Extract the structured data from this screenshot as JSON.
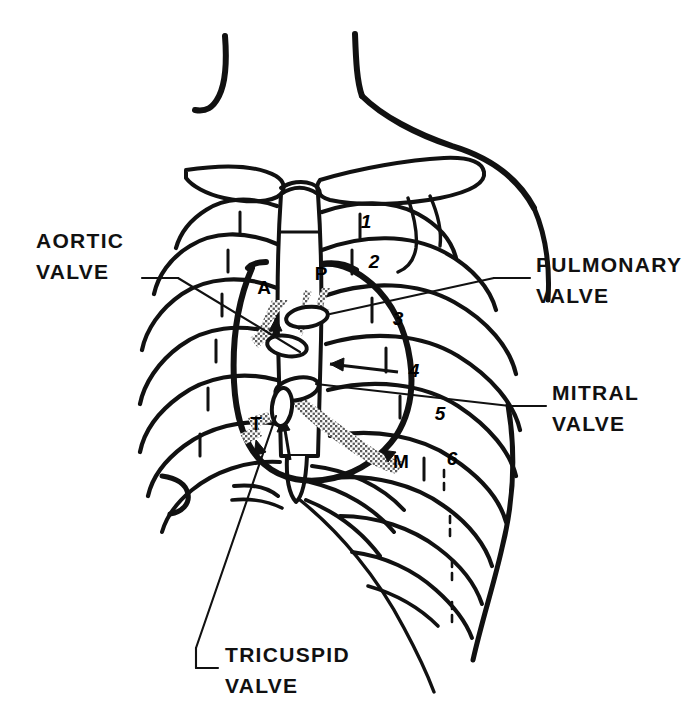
{
  "figure": {
    "background_color": "#ffffff",
    "ink_color": "#111111",
    "stipple_color": "#6e6e6e"
  },
  "labels": [
    {
      "id": "aortic",
      "line1": "AORTIC",
      "line2": "VALVE",
      "marker": "A",
      "x": 36,
      "y": 248,
      "align": "start",
      "marker_x": 264,
      "marker_y": 294
    },
    {
      "id": "pulmonary",
      "line1": "PULMONARY",
      "line2": "VALVE",
      "marker": "P",
      "x": 536,
      "y": 272,
      "align": "start",
      "marker_x": 321,
      "marker_y": 280
    },
    {
      "id": "mitral",
      "line1": "MITRAL",
      "line2": "VALVE",
      "marker": "M",
      "x": 552,
      "y": 400,
      "align": "start",
      "marker_x": 401,
      "marker_y": 468
    },
    {
      "id": "tricuspid",
      "line1": "TRICUSPID",
      "line2": "VALVE",
      "marker": "T",
      "x": 225,
      "y": 662,
      "align": "start",
      "marker_x": 256,
      "marker_y": 430
    }
  ],
  "rib_numbers": [
    {
      "n": "1",
      "x": 366,
      "y": 228
    },
    {
      "n": "2",
      "x": 374,
      "y": 268
    },
    {
      "n": "3",
      "x": 398,
      "y": 325
    },
    {
      "n": "4",
      "x": 414,
      "y": 377
    },
    {
      "n": "5",
      "x": 440,
      "y": 420
    },
    {
      "n": "6",
      "x": 452,
      "y": 465
    }
  ],
  "valve_points": [
    {
      "id": "aortic-ellipse",
      "cx": 307,
      "cy": 317,
      "rx": 21,
      "ry": 10,
      "rot": -8
    },
    {
      "id": "pulmonary-ellipse",
      "cx": 287,
      "cy": 346,
      "rx": 20,
      "ry": 10,
      "rot": 10
    },
    {
      "id": "mitral-ellipse",
      "cx": 297,
      "cy": 389,
      "rx": 22,
      "ry": 11,
      "rot": -12
    },
    {
      "id": "tricuspid-ellipse",
      "cx": 282,
      "cy": 407,
      "rx": 10,
      "ry": 19,
      "rot": 6
    }
  ],
  "anatomy": {
    "neck_left": "left neck contour",
    "neck_right": "right neck and shoulder contour",
    "clavicle_left": "left clavicle",
    "clavicle_right": "right clavicle",
    "sternum": "sternum and xiphoid process",
    "heart_border": "cardiac silhouette border",
    "ribs": "ribs 1 through 10 with costal cartilages"
  }
}
